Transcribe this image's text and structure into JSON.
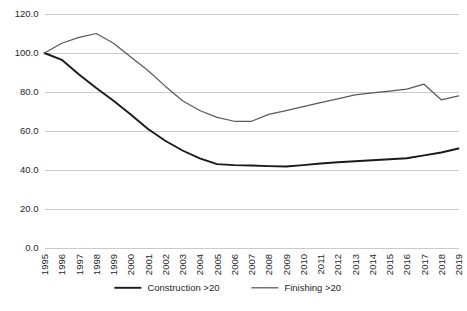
{
  "chart_data": {
    "type": "line",
    "title": "",
    "subtitle": "",
    "xlabel": "",
    "ylabel": "",
    "x": [
      1995,
      1996,
      1997,
      1998,
      1999,
      2000,
      2001,
      2002,
      2003,
      2004,
      2005,
      2006,
      2007,
      2008,
      2009,
      2010,
      2011,
      2012,
      2013,
      2014,
      2015,
      2016,
      2017,
      2018,
      2019
    ],
    "categories": [
      "1995",
      "1996",
      "1997",
      "1998",
      "1999",
      "2000",
      "2001",
      "2002",
      "2003",
      "2004",
      "2005",
      "2006",
      "2007",
      "2008",
      "2009",
      "2010",
      "2011",
      "2012",
      "2013",
      "2014",
      "2015",
      "2016",
      "2017",
      "2018",
      "2019"
    ],
    "series": [
      {
        "name": "Construction >20",
        "color": "#1a1a1a",
        "values": [
          100.0,
          96.5,
          89.0,
          82.0,
          75.5,
          68.5,
          61.0,
          55.0,
          50.0,
          46.0,
          43.0,
          42.5,
          42.3,
          42.0,
          41.8,
          42.5,
          43.3,
          44.0,
          44.5,
          45.0,
          45.5,
          46.0,
          47.5,
          49.0,
          51.0
        ]
      },
      {
        "name": "Finishing >20",
        "color": "#595959",
        "values": [
          100.0,
          105.0,
          108.0,
          110.0,
          105.0,
          98.0,
          91.0,
          83.0,
          75.5,
          70.5,
          67.0,
          65.0,
          65.0,
          68.5,
          70.5,
          72.5,
          74.5,
          76.5,
          78.5,
          79.5,
          80.5,
          81.5,
          84.0,
          76.0,
          78.0
        ]
      }
    ],
    "ylim": [
      0.0,
      120.0
    ],
    "yticks": [
      "0.0",
      "20.0",
      "40.0",
      "60.0",
      "80.0",
      "100.0",
      "120.0"
    ],
    "ytick_values": [
      0,
      20,
      40,
      60,
      80,
      100,
      120
    ],
    "grid": true,
    "legend_position": "bottom"
  },
  "legend": {
    "items": [
      {
        "label": "Construction >20",
        "color": "#1a1a1a"
      },
      {
        "label": "Finishing >20",
        "color": "#595959"
      }
    ]
  },
  "colors": {
    "construction": "#1a1a1a",
    "finishing": "#595959",
    "grid": "#a6a6a6",
    "text": "#262626",
    "background": "#ffffff"
  }
}
